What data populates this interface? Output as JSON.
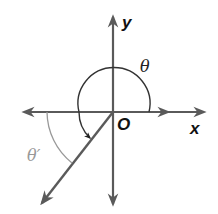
{
  "diagram": {
    "type": "angle-reference-diagram",
    "axes": {
      "x_label": "x",
      "y_label": "y",
      "origin_label": "O"
    },
    "angles": {
      "theta_label": "θ",
      "theta_prime_label": "θ′"
    },
    "colors": {
      "axis": "#5a5a5a",
      "arc": "#333333",
      "reference_arc": "#999999",
      "reference_label": "#999999",
      "text": "#111111"
    }
  }
}
